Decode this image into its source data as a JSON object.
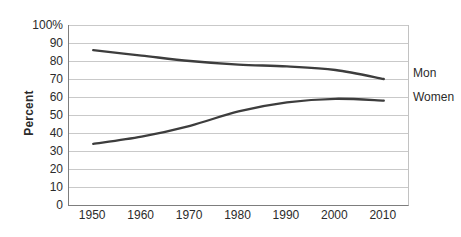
{
  "chart_data": {
    "type": "line",
    "title": "",
    "xlabel": "",
    "ylabel": "Percent",
    "categories": [
      "1950",
      "1960",
      "1970",
      "1980",
      "1990",
      "2000",
      "2010"
    ],
    "series": [
      {
        "name": "Mon",
        "values": [
          86,
          83,
          80,
          78,
          77,
          75,
          70
        ],
        "color": "#3d3d3d"
      },
      {
        "name": "Women",
        "values": [
          34,
          38,
          44,
          52,
          57,
          59,
          58
        ],
        "color": "#3d3d3d"
      }
    ],
    "ylim": [
      0,
      100
    ],
    "ytick_step": 10,
    "ytick_labels": [
      "100%",
      "90",
      "80",
      "70",
      "60",
      "50",
      "40",
      "30",
      "20",
      "10",
      "0"
    ],
    "grid": "horizontal-only",
    "legend_position": "right-of-plot"
  },
  "colors": {
    "line": "#3d3d3d",
    "gridline": "#c9c9c9",
    "axis": "#7d7d7d",
    "plot_right_border": "#c2c2c2",
    "text": "#2b2b2b",
    "background": "#ffffff"
  }
}
